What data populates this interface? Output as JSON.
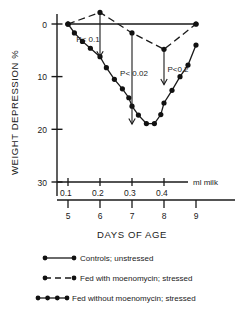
{
  "figure": {
    "y_axis_title": "WEIGHT DEPRESSION %",
    "x_axis_title": "DAYS OF AGE",
    "secondary_axis_label": "ml milk"
  },
  "axes": {
    "y_ticks": [
      "0",
      "10",
      "20",
      "30"
    ],
    "x_ticks_days": [
      "5",
      "6",
      "7",
      "8",
      "9"
    ],
    "x_ticks_milk": [
      "0.1",
      "0.2",
      "0.3",
      "0.4"
    ]
  },
  "annotations": [
    {
      "id": "p1",
      "text": "P< 0.1"
    },
    {
      "id": "p2",
      "text": "P< 0.02"
    },
    {
      "id": "p3",
      "text": "P<0.2"
    }
  ],
  "legend": {
    "items": [
      {
        "style": "solid",
        "label": "Controls; unstressed"
      },
      {
        "style": "dashed",
        "label": "Fed with moenomycin; stressed"
      },
      {
        "style": "dotdash",
        "label": "Fed without moenomycin; stressed"
      }
    ]
  },
  "chart_data": {
    "type": "line",
    "title": "",
    "xlabel": "DAYS OF AGE",
    "ylabel": "WEIGHT DEPRESSION %",
    "xlim": [
      5,
      9
    ],
    "ylim": [
      -3,
      30
    ],
    "y_inverted": true,
    "grid": false,
    "legend_position": "below",
    "secondary_xaxis": {
      "label": "ml milk",
      "ticks": [
        0.1,
        0.2,
        0.3,
        0.4
      ],
      "tick_days": [
        5,
        6,
        7,
        8
      ]
    },
    "yticks": [
      0,
      10,
      20,
      30
    ],
    "xticks": [
      5,
      6,
      7,
      8,
      9
    ],
    "series": [
      {
        "name": "Controls; unstressed",
        "style": "solid",
        "marker": "filled-circle",
        "x": [
          5,
          9
        ],
        "y": [
          0,
          0
        ]
      },
      {
        "name": "Fed with moenomycin; stressed",
        "style": "dashed",
        "marker": "filled-circle",
        "x": [
          5,
          6,
          7,
          8,
          9
        ],
        "y": [
          0,
          -2.2,
          1.7,
          4.8,
          0
        ]
      },
      {
        "name": "Fed without moenomycin; stressed",
        "style": "dotdash",
        "marker": "filled-circle",
        "x": [
          5.0,
          5.2,
          5.45,
          5.7,
          6.0,
          6.2,
          6.45,
          6.7,
          6.9,
          7.0,
          7.2,
          7.45,
          7.7,
          7.9,
          8.0,
          8.25,
          8.5,
          8.75,
          9.0
        ],
        "y": [
          0.0,
          1.7,
          3.3,
          4.6,
          6.2,
          8.3,
          10.5,
          12.3,
          14.0,
          15.6,
          17.3,
          18.9,
          18.9,
          17.2,
          15.0,
          12.6,
          10.0,
          7.8,
          4.0
        ]
      }
    ],
    "pvalue_markers": [
      {
        "label": "P< 0.1",
        "x": 6.0,
        "y_from": -2.2,
        "y_to": 6.2
      },
      {
        "label": "P< 0.02",
        "x": 7.0,
        "y_from": 1.7,
        "y_to": 19.0
      },
      {
        "label": "P<0.2",
        "x": 8.0,
        "y_from": 4.8,
        "y_to": 11.5
      }
    ]
  }
}
